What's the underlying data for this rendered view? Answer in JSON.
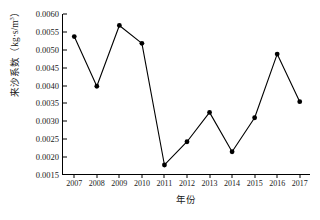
{
  "chart_data": {
    "type": "line",
    "title": "",
    "xlabel": "年份",
    "ylabel": "来沙系数（kg·s/m³）",
    "ylabel_text": "来沙系数",
    "ylabel_unit_open": "（kg·s/m",
    "ylabel_unit_exp": "3",
    "ylabel_unit_close": "）",
    "categories": [
      "2007",
      "2008",
      "2009",
      "2010",
      "2011",
      "2012",
      "2013",
      "2014",
      "2015",
      "2016",
      "2017"
    ],
    "x": [
      2007,
      2008,
      2009,
      2010,
      2011,
      2012,
      2013,
      2014,
      2015,
      2016,
      2017
    ],
    "values": [
      0.00537,
      0.00398,
      0.00568,
      0.00518,
      0.00178,
      0.00243,
      0.00325,
      0.00215,
      0.0031,
      0.00488,
      0.00355
    ],
    "ylim": [
      0.0015,
      0.006
    ],
    "yticks": [
      0.0015,
      0.002,
      0.0025,
      0.003,
      0.0035,
      0.004,
      0.0045,
      0.005,
      0.0055,
      0.006
    ],
    "ytick_labels": [
      "0.0015",
      "0.0020",
      "0.0025",
      "0.0030",
      "0.0035",
      "0.0040",
      "0.0045",
      "0.0050",
      "0.0055",
      "0.0060"
    ],
    "xlim": [
      2006.5,
      2017.5
    ],
    "grid": false,
    "legend": false,
    "legend_position": "none",
    "marker": "filled-circle",
    "line_color": "#000000",
    "marker_color": "#000000",
    "background_color": "#ffffff"
  },
  "caption": {
    "text": ""
  }
}
